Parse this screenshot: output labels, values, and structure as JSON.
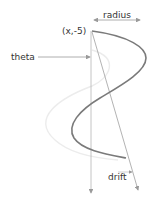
{
  "diagram": {
    "type": "helix-parameter-sketch",
    "labels": {
      "radius": "radius",
      "origin": "(x,-5)",
      "theta": "theta",
      "drift": "drift"
    },
    "colors": {
      "curve": "#7a7a7a",
      "ghost_curve": "#ececec",
      "axis": "#b5b5b5",
      "arrow": "#9a9a9a",
      "text": "#333333"
    }
  }
}
